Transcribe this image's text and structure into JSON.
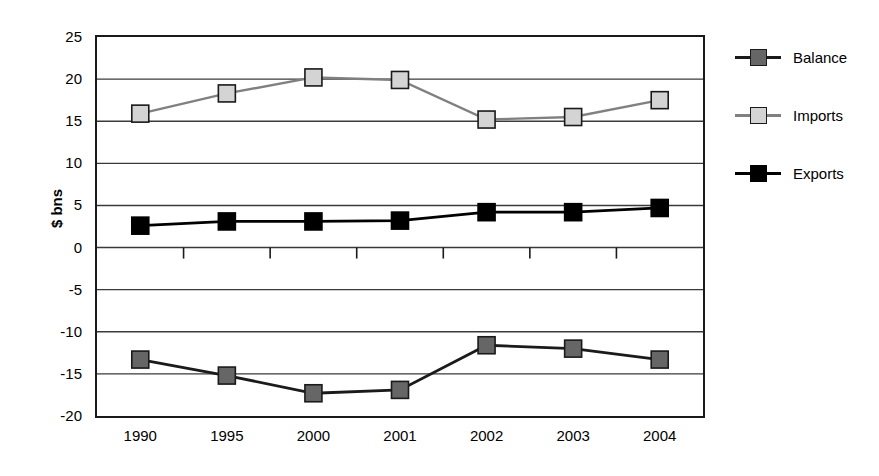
{
  "chart_data": {
    "type": "line",
    "title": "",
    "xlabel": "",
    "ylabel": "$ bns",
    "categories": [
      "1990",
      "1995",
      "2000",
      "2001",
      "2002",
      "2003",
      "2004"
    ],
    "ylim": [
      -20,
      25
    ],
    "ytick_step": 5,
    "yticks": [
      "25",
      "20",
      "15",
      "10",
      "5",
      "0",
      "-5",
      "-10",
      "-15",
      "-20"
    ],
    "grid": "horizontal",
    "legend_position": "right",
    "series": [
      {
        "name": "Balance",
        "color": "#666666",
        "line_color": "#1a1a1a",
        "marker": "square",
        "values": [
          -13.3,
          -15.2,
          -17.3,
          -16.9,
          -11.6,
          -12.0,
          -13.3
        ]
      },
      {
        "name": "Imports",
        "color": "#d4d4d4",
        "line_color": "#808080",
        "marker": "square",
        "values": [
          15.9,
          18.3,
          20.2,
          19.9,
          15.2,
          15.5,
          17.5
        ]
      },
      {
        "name": "Exports",
        "color": "#000000",
        "line_color": "#000000",
        "marker": "square",
        "values": [
          2.6,
          3.1,
          3.1,
          3.2,
          4.2,
          4.2,
          4.7
        ]
      }
    ]
  },
  "colors": {
    "frame": "#1a1a1a",
    "gridline": "#3a3a3a",
    "background": "#ffffff"
  }
}
